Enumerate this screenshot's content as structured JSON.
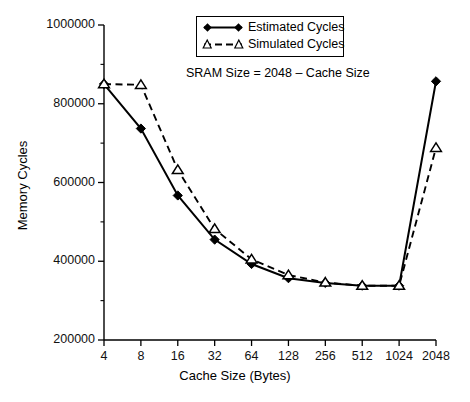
{
  "chart_data": {
    "type": "line",
    "title": "",
    "annotation": "SRAM Size = 2048 – Cache Size",
    "xlabel": "Cache Size (Bytes)",
    "ylabel": "Memory Cycles",
    "categories": [
      "4",
      "8",
      "16",
      "32",
      "64",
      "128",
      "256",
      "512",
      "1024",
      "2048"
    ],
    "x_tick_labels": [
      "4",
      "8",
      "16",
      "32",
      "64",
      "128",
      "256",
      "512",
      "1024",
      "2048"
    ],
    "y_tick_labels": [
      "200000",
      "400000",
      "600000",
      "800000",
      "1000000"
    ],
    "y_ticks": [
      200000,
      400000,
      600000,
      800000,
      1000000
    ],
    "ylim": [
      200000,
      1000000
    ],
    "grid": false,
    "legend_position": "top-center",
    "series": [
      {
        "name": "Estimated Cycles",
        "marker": "filled-diamond",
        "line": "solid",
        "color": "#000000",
        "values": [
          850000,
          737000,
          567000,
          455000,
          393000,
          357000,
          345000,
          338000,
          338000,
          857000
        ]
      },
      {
        "name": "Simulated Cycles",
        "marker": "open-triangle",
        "line": "dashed",
        "color": "#000000",
        "values": [
          850000,
          848000,
          632000,
          482000,
          405000,
          365000,
          346000,
          338000,
          338000,
          688000
        ]
      }
    ]
  },
  "legend": {
    "items": [
      {
        "label": "Estimated Cycles",
        "marker": "filled-diamond",
        "line": "solid"
      },
      {
        "label": "Simulated Cycles",
        "marker": "open-triangle",
        "line": "dashed"
      }
    ]
  },
  "axes": {
    "x_title": "Cache Size (Bytes)",
    "y_title": "Memory Cycles"
  },
  "annotation": {
    "text": "SRAM Size = 2048 – Cache Size"
  }
}
